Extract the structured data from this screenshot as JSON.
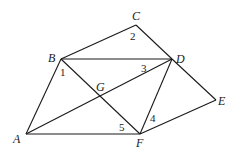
{
  "diagram": {
    "points": {
      "A": {
        "label": "A",
        "x": 26,
        "y": 134
      },
      "B": {
        "label": "B",
        "x": 61,
        "y": 59
      },
      "C": {
        "label": "C",
        "x": 136,
        "y": 25
      },
      "D": {
        "label": "D",
        "x": 172,
        "y": 59
      },
      "E": {
        "label": "E",
        "x": 216,
        "y": 100
      },
      "F": {
        "label": "F",
        "x": 140,
        "y": 134
      },
      "G": {
        "label": "G",
        "x": 101,
        "y": 96
      }
    },
    "segments": [
      "AB",
      "BC",
      "CD",
      "DE",
      "EF",
      "AF",
      "BD",
      "AD",
      "BF",
      "DF"
    ],
    "angle_labels": {
      "a1": "1",
      "a2": "2",
      "a3": "3",
      "a4": "4",
      "a5": "5"
    }
  }
}
